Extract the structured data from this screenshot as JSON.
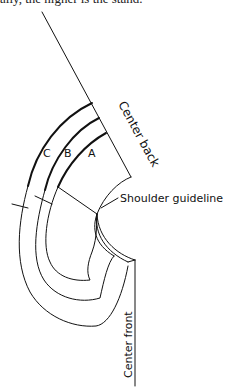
{
  "caption": {
    "text": "ally, the higher is the stand."
  },
  "diagram": {
    "type": "collar pattern draft",
    "labels": {
      "center_back": "Center back",
      "center_front": "Center front",
      "shoulder_guideline": "Shoulder guideline"
    },
    "collar_pieces": [
      {
        "id": "A",
        "label": "A"
      },
      {
        "id": "B",
        "label": "B"
      },
      {
        "id": "C",
        "label": "C"
      }
    ],
    "colors": {
      "line": "#111111",
      "background": "#ffffff"
    }
  }
}
